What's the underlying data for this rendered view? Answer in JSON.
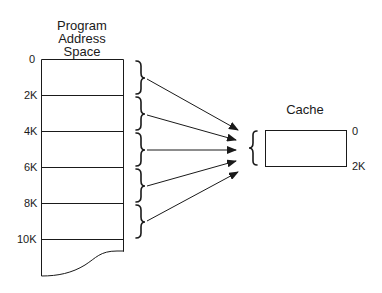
{
  "program_space": {
    "title_lines": [
      "Program",
      "Address",
      "Space"
    ],
    "address_labels": [
      "0",
      "2K",
      "4K",
      "6K",
      "8K",
      "10K"
    ]
  },
  "cache": {
    "title": "Cache",
    "start_label": "0",
    "end_label": "2K"
  },
  "mapping": {
    "segments": 6,
    "description": "Each 2K block of program address space maps to the 2K cache"
  },
  "colors": {
    "line": "#1a1a1a",
    "background": "#ffffff"
  }
}
